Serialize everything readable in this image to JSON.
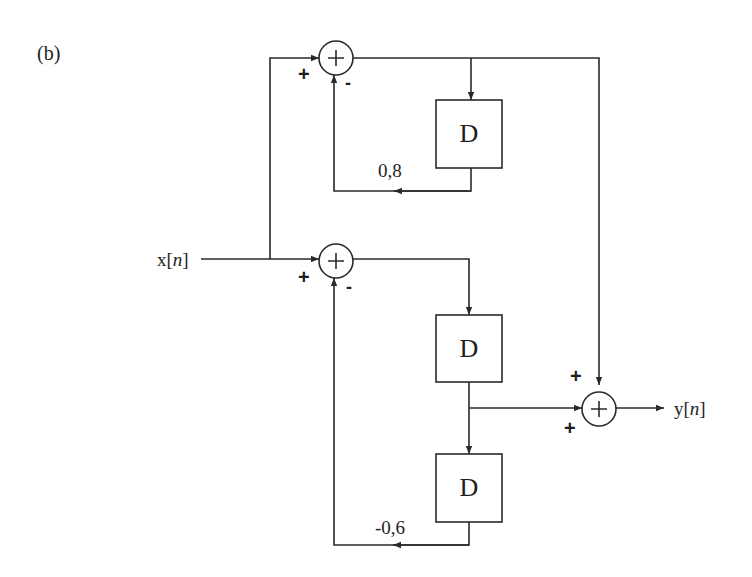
{
  "figure_label": "(b)",
  "input": {
    "prefix": "x[",
    "var": "n",
    "suffix": "]"
  },
  "output": {
    "prefix": "y[",
    "var": "n",
    "suffix": "]"
  },
  "delays": [
    {
      "id": "D1",
      "label": "D"
    },
    {
      "id": "D2",
      "label": "D"
    },
    {
      "id": "D3",
      "label": "D"
    }
  ],
  "adders": [
    {
      "id": "top",
      "symbol": "+",
      "input_signs": {
        "left": "+",
        "bottom": "-"
      }
    },
    {
      "id": "lower",
      "symbol": "+",
      "input_signs": {
        "left": "+",
        "bottom": "-"
      }
    },
    {
      "id": "output",
      "symbol": "+",
      "input_signs": {
        "top": "+",
        "left": "+"
      }
    }
  ],
  "gains": {
    "top_feedback": "0,8",
    "bottom_feedback": "-0,6"
  },
  "colors": {
    "stroke": "#2a2a2a",
    "background": "#ffffff"
  }
}
